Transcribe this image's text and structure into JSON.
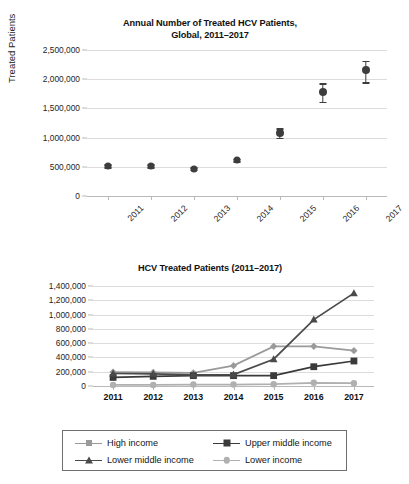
{
  "top_chart": {
    "title_line1": "Annual Number of Treated HCV Patients,",
    "title_line2": "Global, 2011–2017",
    "ylabel": "Treated Patients",
    "yticks": [
      "0",
      "500,000",
      "1,000,000",
      "1,500,000",
      "2,000,000",
      "2,500,000"
    ],
    "xticks": [
      "2011",
      "2012",
      "2013",
      "2014",
      "2015",
      "2016",
      "2017"
    ]
  },
  "bottom_chart": {
    "title": "HCV Treated Patients (2011–2017)",
    "yticks": [
      "0",
      "200,000",
      "400,000",
      "600,000",
      "800,000",
      "1,000,000",
      "1,200,000",
      "1,400,000"
    ],
    "xticks": [
      "2011",
      "2012",
      "2013",
      "2014",
      "2015",
      "2016",
      "2017"
    ],
    "legend": [
      {
        "label": "High income",
        "marker": "diamond",
        "color": "#9a9a9a"
      },
      {
        "label": "Upper middle income",
        "marker": "square",
        "color": "#3a3a3a"
      },
      {
        "label": "Lower middle income",
        "marker": "triangle",
        "color": "#4a4a4a"
      },
      {
        "label": "Lower income",
        "marker": "circle",
        "color": "#b0b0b0"
      }
    ]
  },
  "chart_data": [
    {
      "type": "scatter",
      "title": "Annual Number of Treated HCV Patients, Global, 2011–2017",
      "xlabel": "",
      "ylabel": "Treated Patients",
      "x": [
        "2011",
        "2012",
        "2013",
        "2014",
        "2015",
        "2016",
        "2017"
      ],
      "values": [
        515000,
        515000,
        470000,
        615000,
        1075000,
        1780000,
        2155000
      ],
      "error_low": [
        490000,
        490000,
        450000,
        595000,
        1000000,
        1610000,
        1950000
      ],
      "error_high": [
        545000,
        540000,
        490000,
        640000,
        1160000,
        1930000,
        2310000
      ],
      "ylim": [
        0,
        2500000
      ],
      "ytick_values": [
        0,
        500000,
        1000000,
        1500000,
        2000000,
        2500000
      ],
      "grid": true,
      "legend": "none"
    },
    {
      "type": "line",
      "title": "HCV Treated Patients (2011–2017)",
      "xlabel": "",
      "ylabel": "",
      "categories": [
        "2011",
        "2012",
        "2013",
        "2014",
        "2015",
        "2016",
        "2017"
      ],
      "ylim": [
        0,
        1400000
      ],
      "ytick_values": [
        0,
        200000,
        400000,
        600000,
        800000,
        1000000,
        1200000,
        1400000
      ],
      "grid": true,
      "legend": "bottom",
      "series": [
        {
          "name": "High income",
          "marker": "diamond",
          "color": "#9a9a9a",
          "values": [
            195000,
            190000,
            185000,
            285000,
            555000,
            555000,
            495000
          ]
        },
        {
          "name": "Upper middle income",
          "marker": "square",
          "color": "#3a3a3a",
          "values": [
            120000,
            135000,
            145000,
            145000,
            145000,
            270000,
            350000
          ]
        },
        {
          "name": "Lower middle income",
          "marker": "triangle",
          "color": "#4a4a4a",
          "values": [
            175000,
            170000,
            155000,
            160000,
            375000,
            930000,
            1300000
          ]
        },
        {
          "name": "Lower income",
          "marker": "circle",
          "color": "#b0b0b0",
          "values": [
            15000,
            15000,
            20000,
            20000,
            25000,
            45000,
            40000
          ]
        }
      ]
    }
  ]
}
